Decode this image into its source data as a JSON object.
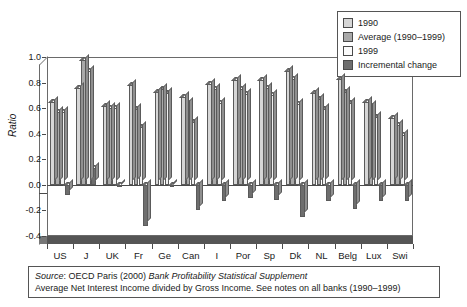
{
  "chart_data": {
    "type": "bar",
    "title": "",
    "xlabel": "",
    "ylabel": "Ratio",
    "ylim": [
      -0.4,
      1.0
    ],
    "ytick_labels": [
      "1.0",
      "0.8",
      "0.6",
      "0.4",
      "0.2",
      "0.0",
      "-0.2",
      "-0.4"
    ],
    "ytick_values": [
      1.0,
      0.8,
      0.6,
      0.4,
      0.2,
      0.0,
      -0.2,
      -0.4
    ],
    "grid": false,
    "legend_position": "top-right",
    "categories": [
      "US",
      "J",
      "UK",
      "Fr",
      "Ge",
      "Can",
      "I",
      "Por",
      "Sp",
      "Dk",
      "NL",
      "Belg",
      "Lux",
      "Swi"
    ],
    "series": [
      {
        "name": "1990",
        "color": "#d6d6d6",
        "values": [
          0.65,
          0.76,
          0.62,
          0.78,
          0.73,
          0.69,
          0.79,
          0.82,
          0.82,
          0.89,
          0.72,
          0.83,
          0.65,
          0.52
        ]
      },
      {
        "name": "Average (1990–1999)",
        "color": "#a9a9a9",
        "values": [
          0.57,
          0.98,
          0.6,
          0.59,
          0.75,
          0.64,
          0.75,
          0.75,
          0.76,
          0.83,
          0.67,
          0.73,
          0.62,
          0.47
        ]
      },
      {
        "name": "1999",
        "color": "#f0f0f0",
        "values": [
          0.57,
          0.89,
          0.6,
          0.45,
          0.72,
          0.49,
          0.64,
          0.71,
          0.7,
          0.63,
          0.59,
          0.64,
          0.53,
          0.39
        ]
      },
      {
        "name": "Incremental change",
        "color": "#6e6e6e",
        "values": [
          -0.08,
          0.13,
          -0.01,
          -0.32,
          -0.01,
          -0.2,
          -0.13,
          -0.1,
          -0.12,
          -0.25,
          -0.13,
          -0.19,
          -0.13,
          -0.13
        ]
      }
    ]
  },
  "legend": {
    "items": [
      {
        "label": "1990",
        "swatch": "#d6d6d6"
      },
      {
        "label": "Average (1990–1999)",
        "swatch": "#a9a9a9"
      },
      {
        "label": "1999",
        "swatch": "#fbfbfb"
      },
      {
        "label": "Incremental change",
        "swatch": "#6e6e6e"
      }
    ]
  },
  "caption": {
    "line1_prefix": "Source",
    "line1_mid": ": OECD Paris (2000) ",
    "line1_italic": "Bank Profitability Statistical Supplement",
    "line2": "Average Net Interest Income divided by Gross Income. See notes on all banks (1990–1999)"
  }
}
